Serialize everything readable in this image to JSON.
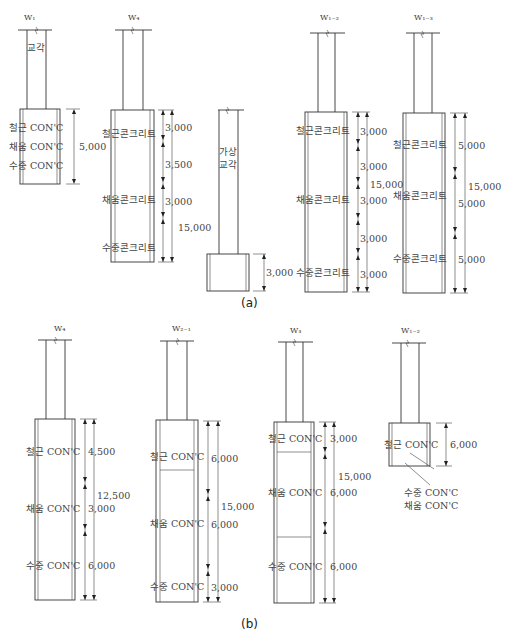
{
  "figure": {
    "caption_a": "(a)",
    "caption_b": "(b)"
  },
  "panel_a": {
    "w1": {
      "label": "W₁",
      "shaft_text": "교각",
      "layers": [
        "철근 CON'C",
        "채움 CON'C",
        "수중 CON'C"
      ],
      "dim_total": "5,000"
    },
    "w4": {
      "label": "W₄",
      "layers": [
        "철근콘크리트",
        "채움콘크리트",
        "수중콘크리트"
      ],
      "dims": [
        "3,000",
        "3,500",
        "3,000"
      ],
      "dim_total": "15,000"
    },
    "temp": {
      "shaft_text_1": "가상",
      "shaft_text_2": "교각",
      "dim": "3,000"
    },
    "w12": {
      "label": "W₁₋₂",
      "layers": [
        "철근콘크리트",
        "채움콘크리트",
        "수중콘크리트"
      ],
      "dims": [
        "3,000",
        "3,000",
        "3,000",
        "3,000",
        "3,000"
      ],
      "dim_total": "15,000"
    },
    "w13": {
      "label": "W₁₋₃",
      "layers": [
        "철근콘크리트",
        "채움콘크리트",
        "수중콘크리트"
      ],
      "dims": [
        "5,000",
        "5,000",
        "5,000"
      ],
      "dim_total": "15,000"
    }
  },
  "panel_b": {
    "w4": {
      "label": "W₄",
      "layers": [
        "철근 CON'C",
        "채움 CON'C",
        "수중 CON'C"
      ],
      "dims": [
        "4,500",
        "3,000",
        "6,000"
      ],
      "dim_total": "12,500"
    },
    "w21": {
      "label": "W₂₋₁",
      "layers": [
        "철근 CON'C",
        "채움 CON'C",
        "수중 CON'C"
      ],
      "dims": [
        "6,000",
        "6,000",
        "3,000"
      ],
      "dim_total": "15,000"
    },
    "w3": {
      "label": "W₃",
      "layers": [
        "철근 CON'C",
        "채움 CON'C",
        "수중 CON'C"
      ],
      "dims": [
        "3,000",
        "6,000",
        "6,000"
      ],
      "dim_total": "15,000"
    },
    "w12": {
      "label": "W₁₋₂",
      "layers": [
        "철근 CON'C"
      ],
      "dim": "6,000",
      "leader_1": "수중 CON'C",
      "leader_2": "채움 CON'C"
    }
  }
}
